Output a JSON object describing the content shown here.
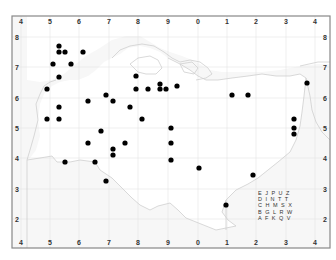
{
  "map": {
    "frame": {
      "x": 12,
      "y": 16,
      "width": 318,
      "height": 232,
      "stroke": "#888888"
    },
    "grid_color": "#e4e4e4",
    "coast_color": "#cfcfcf",
    "land_fill": "#ffffff",
    "sea_fill": "#f7f7f7",
    "dot_color": "#000000",
    "x_ticks": [
      {
        "label": "4",
        "x": 21
      },
      {
        "label": "5",
        "x": 50
      },
      {
        "label": "6",
        "x": 79
      },
      {
        "label": "7",
        "x": 109
      },
      {
        "label": "8",
        "x": 138
      },
      {
        "label": "9",
        "x": 168
      },
      {
        "label": "0",
        "x": 198
      },
      {
        "label": "1",
        "x": 227
      },
      {
        "label": "2",
        "x": 256
      },
      {
        "label": "3",
        "x": 286
      },
      {
        "label": "4",
        "x": 315
      }
    ],
    "y_ticks": [
      {
        "label": "8",
        "y": 37
      },
      {
        "label": "7",
        "y": 67
      },
      {
        "label": "6",
        "y": 98
      },
      {
        "label": "5",
        "y": 128
      },
      {
        "label": "4",
        "y": 158
      },
      {
        "label": "3",
        "y": 189
      },
      {
        "label": "2",
        "y": 219
      }
    ],
    "points": [
      {
        "x": 59,
        "y": 46
      },
      {
        "x": 59,
        "y": 52
      },
      {
        "x": 65,
        "y": 52
      },
      {
        "x": 83,
        "y": 52
      },
      {
        "x": 53,
        "y": 64
      },
      {
        "x": 71,
        "y": 64
      },
      {
        "x": 59,
        "y": 77
      },
      {
        "x": 47,
        "y": 89
      },
      {
        "x": 59,
        "y": 107
      },
      {
        "x": 47,
        "y": 119
      },
      {
        "x": 59,
        "y": 119
      },
      {
        "x": 88,
        "y": 101
      },
      {
        "x": 106,
        "y": 95
      },
      {
        "x": 113,
        "y": 101
      },
      {
        "x": 136,
        "y": 76
      },
      {
        "x": 136,
        "y": 89
      },
      {
        "x": 148,
        "y": 89
      },
      {
        "x": 160,
        "y": 84
      },
      {
        "x": 160,
        "y": 89
      },
      {
        "x": 166,
        "y": 89
      },
      {
        "x": 177,
        "y": 86
      },
      {
        "x": 130,
        "y": 107
      },
      {
        "x": 142,
        "y": 119
      },
      {
        "x": 232,
        "y": 95
      },
      {
        "x": 248,
        "y": 95
      },
      {
        "x": 307,
        "y": 83
      },
      {
        "x": 294,
        "y": 119
      },
      {
        "x": 294,
        "y": 128
      },
      {
        "x": 294,
        "y": 134
      },
      {
        "x": 101,
        "y": 131
      },
      {
        "x": 88,
        "y": 143
      },
      {
        "x": 125,
        "y": 143
      },
      {
        "x": 113,
        "y": 149
      },
      {
        "x": 113,
        "y": 155
      },
      {
        "x": 171,
        "y": 128
      },
      {
        "x": 171,
        "y": 143
      },
      {
        "x": 65,
        "y": 162
      },
      {
        "x": 95,
        "y": 162
      },
      {
        "x": 171,
        "y": 160
      },
      {
        "x": 199,
        "y": 168
      },
      {
        "x": 106,
        "y": 181
      },
      {
        "x": 253,
        "y": 175
      },
      {
        "x": 226,
        "y": 205
      }
    ],
    "legend": {
      "x": 258,
      "y": 195,
      "rows": [
        "E J P U Z",
        "D I N T T",
        "C H M S X",
        "B G L R W",
        "A F K Q V"
      ]
    }
  }
}
